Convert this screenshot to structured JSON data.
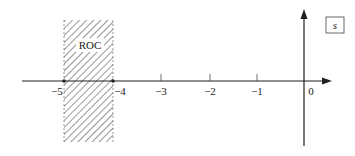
{
  "diagram": {
    "type": "s-plane region of convergence",
    "plane_label": "s",
    "roc_label": "ROC",
    "roc_range": [
      -5,
      -4
    ],
    "tick_labels": [
      "−5",
      "−4",
      "−3",
      "−2",
      "−1",
      "0"
    ],
    "colors": {
      "axis": "#222222",
      "hatch": "#333333",
      "background": "#ffffff"
    }
  }
}
